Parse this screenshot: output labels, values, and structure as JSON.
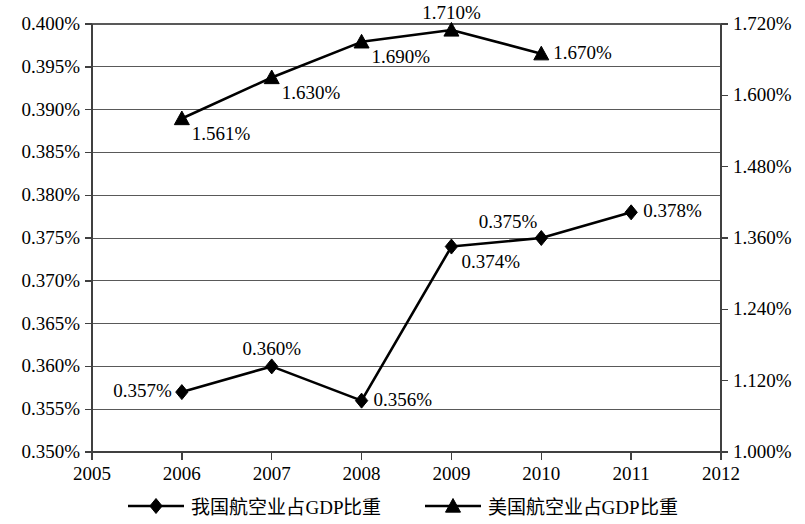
{
  "chart_data": {
    "type": "line",
    "title": "",
    "subtitle": "",
    "xlabel": "",
    "ylabel": "",
    "grid": true,
    "legend_position": "bottom",
    "x": [
      2005,
      2006,
      2007,
      2008,
      2009,
      2010,
      2011,
      2012
    ],
    "x_tick_labels": [
      "2005",
      "2006",
      "2007",
      "2008",
      "2009",
      "2010",
      "2011",
      "2012"
    ],
    "xlim": [
      2005,
      2012
    ],
    "axes": {
      "left": {
        "ylim": [
          0.35,
          0.4
        ],
        "tick_values": [
          0.35,
          0.355,
          0.36,
          0.365,
          0.37,
          0.375,
          0.38,
          0.385,
          0.39,
          0.395,
          0.4
        ],
        "tick_labels": [
          "0.350%",
          "0.355%",
          "0.360%",
          "0.365%",
          "0.370%",
          "0.375%",
          "0.380%",
          "0.385%",
          "0.390%",
          "0.395%",
          "0.400%"
        ]
      },
      "right": {
        "ylim": [
          1.0,
          1.72
        ],
        "tick_values": [
          1.0,
          1.12,
          1.24,
          1.36,
          1.48,
          1.6,
          1.72
        ],
        "tick_labels": [
          "1.000%",
          "1.120%",
          "1.240%",
          "1.360%",
          "1.480%",
          "1.600%",
          "1.720%"
        ]
      }
    },
    "series": [
      {
        "name": "我国航空业占GDP比重",
        "axis": "left",
        "marker": "diamond",
        "color": "#000000",
        "points": [
          {
            "x": 2006,
            "y": 0.357,
            "label": "0.357%",
            "label_pos": "left"
          },
          {
            "x": 2007,
            "y": 0.36,
            "label": "0.360%",
            "label_pos": "above"
          },
          {
            "x": 2008,
            "y": 0.356,
            "label": "0.356%",
            "label_pos": "right"
          },
          {
            "x": 2009,
            "y": 0.374,
            "label": "0.374%",
            "label_pos": "below-right"
          },
          {
            "x": 2010,
            "y": 0.375,
            "label": "0.375%",
            "label_pos": "above-left"
          },
          {
            "x": 2011,
            "y": 0.378,
            "label": "0.378%",
            "label_pos": "right"
          }
        ]
      },
      {
        "name": "美国航空业占GDP比重",
        "axis": "right",
        "marker": "triangle",
        "color": "#000000",
        "points": [
          {
            "x": 2006,
            "y": 1.561,
            "label": "1.561%",
            "label_pos": "below-right"
          },
          {
            "x": 2007,
            "y": 1.63,
            "label": "1.630%",
            "label_pos": "below-right"
          },
          {
            "x": 2008,
            "y": 1.69,
            "label": "1.690%",
            "label_pos": "below-right"
          },
          {
            "x": 2009,
            "y": 1.71,
            "label": "1.710%",
            "label_pos": "above"
          },
          {
            "x": 2010,
            "y": 1.67,
            "label": "1.670%",
            "label_pos": "right"
          }
        ]
      }
    ]
  },
  "legend": {
    "entries": [
      {
        "label": "我国航空业占GDP比重",
        "marker": "diamond"
      },
      {
        "label": "美国航空业占GDP比重",
        "marker": "triangle"
      }
    ]
  }
}
